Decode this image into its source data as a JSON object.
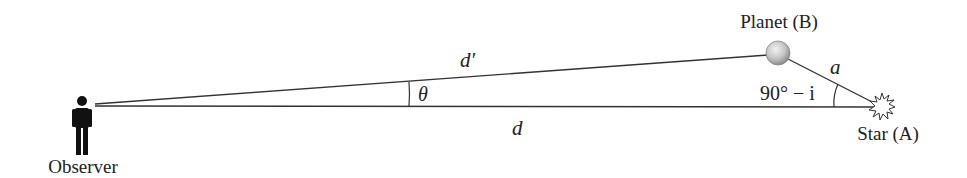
{
  "diagram": {
    "labels": {
      "observer": "Observer",
      "planet": "Planet (B)",
      "star": "Star (A)",
      "d_prime": "d′",
      "d": "d",
      "a": "a",
      "theta": "θ",
      "angle_at_star": "90° − i"
    },
    "points": {
      "observer": {
        "x": 95,
        "y": 104
      },
      "planet": {
        "x": 778,
        "y": 52
      },
      "star": {
        "x": 880,
        "y": 106
      }
    },
    "colors": {
      "line": "#333333",
      "text": "#222222",
      "planet_fill": "#c8c8c8"
    }
  }
}
